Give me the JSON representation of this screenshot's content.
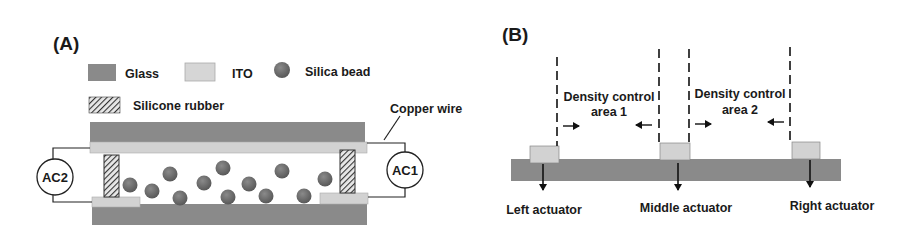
{
  "colors": {
    "glass": "#8a8a8a",
    "ito": "#d2d2d2",
    "bead": "#6e6e6e",
    "line": "#222222",
    "text": "#1a1a1a"
  },
  "panel_a": {
    "label": "(A)",
    "legend": {
      "glass": "Glass",
      "ito": "ITO",
      "bead": "Silica bead",
      "rubber": "Silicone rubber"
    },
    "copper_wire": "Copper wire",
    "ac_left": "AC2",
    "ac_right": "AC1"
  },
  "panel_b": {
    "label": "(B)",
    "area1_line1": "Density control",
    "area1_line2": "area 1",
    "area2_line1": "Density control",
    "area2_line2": "area 2",
    "left_actuator": "Left actuator",
    "middle_actuator": "Middle actuator",
    "right_actuator": "Right actuator"
  }
}
